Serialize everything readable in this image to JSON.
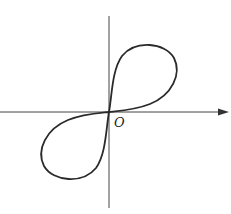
{
  "diagram": {
    "type": "coordinate-plot",
    "origin_label": "O",
    "axes": {
      "x_axis": {
        "has_arrow": true,
        "direction": "right"
      },
      "y_axis": {
        "has_arrow": false
      }
    },
    "curve": {
      "shape": "figure-eight",
      "loops": [
        "upper-right",
        "lower-left"
      ],
      "symmetry": "point-symmetric about origin"
    },
    "colors": {
      "stroke": "#2a2a2a",
      "axis": "#444444",
      "background": "#ffffff"
    }
  }
}
